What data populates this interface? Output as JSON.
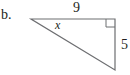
{
  "problem_label": "b.",
  "triangle": {
    "top_side_label": "9",
    "right_side_label": "5",
    "angle_label": "x",
    "right_angle_marker": "top-right",
    "line_color": "#6d6e71"
  }
}
